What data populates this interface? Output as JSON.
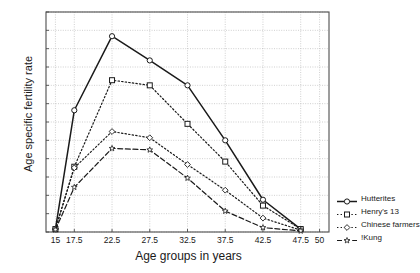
{
  "chart_data": {
    "type": "line",
    "title": "",
    "xlabel": "Age groups in years",
    "ylabel": "Age specific fertility rate",
    "xlim": [
      13.75,
      51.25
    ],
    "ylim": [
      0,
      600
    ],
    "grid": true,
    "legend_position": "right",
    "x_ticks": [
      "15",
      "17.5",
      "22.5",
      "27.5",
      "32.5",
      "37.5",
      "42.5",
      "47.5",
      "50"
    ],
    "x_tick_values": [
      15,
      17.5,
      22.5,
      27.5,
      32.5,
      37.5,
      42.5,
      47.5,
      50
    ],
    "y_ticks": [
      "0",
      "50",
      "100",
      "150",
      "200",
      "250",
      "300",
      "350",
      "400",
      "450",
      "500",
      "550",
      "600"
    ],
    "y_tick_values": [
      0,
      50,
      100,
      150,
      200,
      250,
      300,
      350,
      400,
      450,
      500,
      550,
      600
    ],
    "categories": [
      15,
      17.5,
      22.5,
      27.5,
      32.5,
      37.5,
      42.5,
      47.5
    ],
    "series": [
      {
        "name": "Hutterites",
        "marker": "circle-open",
        "line_style": "solid",
        "color": "#1a1a1a",
        "values": [
          8,
          332,
          534,
          468,
          400,
          250,
          88,
          8
        ]
      },
      {
        "name": "Henry's 13",
        "marker": "square-open",
        "line_style": "dotted",
        "color": "#1a1a1a",
        "values": [
          8,
          178,
          414,
          400,
          295,
          192,
          72,
          8
        ]
      },
      {
        "name": "Chinese farmers",
        "marker": "diamond-open",
        "line_style": "dotted",
        "color": "#1a1a1a",
        "values": [
          8,
          175,
          274,
          257,
          184,
          114,
          38,
          5
        ]
      },
      {
        "name": "!Kung",
        "marker": "star-open",
        "line_style": "dashed",
        "color": "#1a1a1a",
        "values": [
          6,
          122,
          228,
          224,
          147,
          57,
          12,
          3
        ]
      }
    ]
  },
  "axes": {
    "frame_color": "#4d4d4d",
    "grid_color": "#b0b0b0",
    "background": "#ffffff"
  }
}
